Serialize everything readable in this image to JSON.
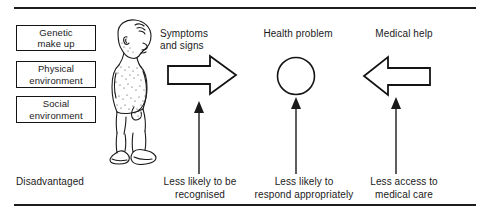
{
  "figure": {
    "rule_color": "#1c1c1c"
  },
  "factors": {
    "heading": "Background factors",
    "items": [
      {
        "line1": "Genetic",
        "line2": "make up",
        "name": "genetic-make-up"
      },
      {
        "line1": "Physical",
        "line2": "environment",
        "name": "physical-environment"
      },
      {
        "line1": "Social",
        "line2": "environment",
        "name": "social-environment"
      }
    ]
  },
  "illustration": {
    "label": "child-line-drawing",
    "description": "Line drawing of a barefoot child in profile, head turned, wearing shorts and shoes"
  },
  "columns": [
    {
      "heading": "Symptoms\nand signs",
      "shape": "right-arrow",
      "name": "symptoms-and-signs"
    },
    {
      "heading": "Health problem",
      "shape": "circle",
      "name": "health-problem"
    },
    {
      "heading": "Medical help",
      "shape": "left-arrow",
      "name": "medical-help"
    }
  ],
  "captions": {
    "disadvantaged": "Disadvantaged",
    "recognised": "Less likely to be\nrecognised",
    "respond": "Less likely to\nrespond appropriately",
    "access": "Less access to\nmedical care"
  }
}
